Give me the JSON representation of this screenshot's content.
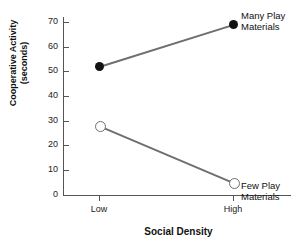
{
  "chart_data": {
    "type": "line",
    "title": "",
    "xlabel": "Social Density",
    "ylabel_line1": "Cooperative Activity",
    "ylabel_line2": "(seconds)",
    "categories": [
      "Low",
      "High"
    ],
    "yticks": [
      0,
      10,
      20,
      30,
      40,
      50,
      60,
      70
    ],
    "ylim": [
      0,
      75
    ],
    "grid": false,
    "legend_position": "inline-right-of-endpoints",
    "series": [
      {
        "name": "Many Play Materials",
        "label_line1": "Many Play",
        "label_line2": "Materials",
        "marker": "filled-circle",
        "values": [
          52,
          69
        ]
      },
      {
        "name": "Few Play Materials",
        "label_line1": "Few Play",
        "label_line2": "Materials",
        "marker": "open-circle",
        "values": [
          28,
          5
        ]
      }
    ],
    "line_color": "#6f6f6f",
    "marker_fill_color": "#121212",
    "axis_color": "#555555"
  }
}
